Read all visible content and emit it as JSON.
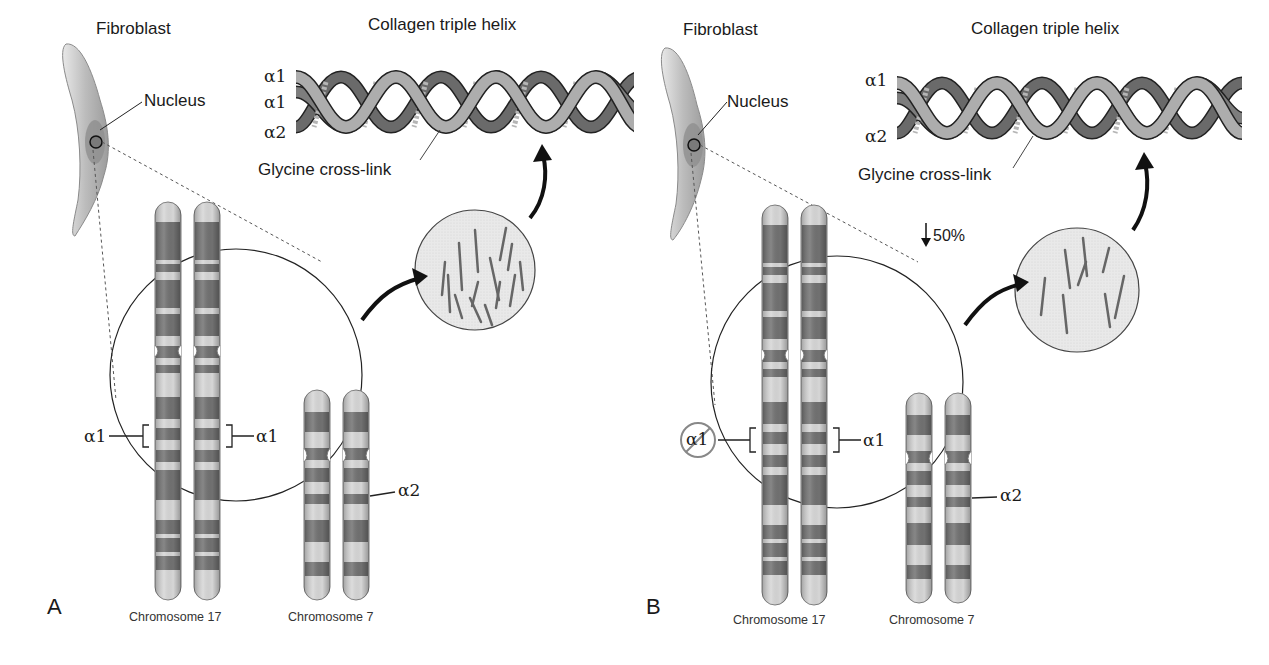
{
  "figure": {
    "panels": [
      {
        "id": "A",
        "panel_label": "A",
        "cell_label": "Fibroblast",
        "nucleus_label": "Nucleus",
        "helix_title": "Collagen triple helix",
        "helix_strands": [
          "α1",
          "α1",
          "α2"
        ],
        "crosslink_label": "Glycine cross-link",
        "reduction_label": "",
        "chromosome_17_label": "Chromosome 17",
        "chromosome_7_label": "Chromosome 7",
        "gene_left": "α1",
        "gene_right": "α1",
        "gene_a2": "α2",
        "left_allele_deleted": false
      },
      {
        "id": "B",
        "panel_label": "B",
        "cell_label": "Fibroblast",
        "nucleus_label": "Nucleus",
        "helix_title": "Collagen triple helix",
        "helix_strands": [
          "α1",
          "α2"
        ],
        "crosslink_label": "Glycine cross-link",
        "reduction_label": "50%",
        "chromosome_17_label": "Chromosome 17",
        "chromosome_7_label": "Chromosome 7",
        "gene_left": "α1",
        "gene_right": "α1",
        "gene_a2": "α2",
        "left_allele_deleted": true
      }
    ],
    "colors": {
      "line": "#1a1a1a",
      "band_dark": "#6f6f6f",
      "band_light": "#cfcfcf",
      "cell_fill": "#bdbdbd",
      "nucleus_fill": "#8a8a8a",
      "fibril_bg": "#e6e6e6",
      "deleted_circle": "#888888"
    }
  }
}
